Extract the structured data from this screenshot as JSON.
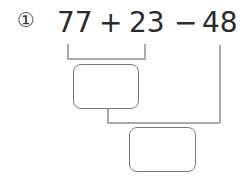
{
  "problem": {
    "number_label": "①",
    "terms": [
      "77",
      "23",
      "48"
    ],
    "operators": [
      "+",
      "−"
    ]
  },
  "answer_boxes": [
    {
      "value": ""
    },
    {
      "value": ""
    }
  ],
  "colors": {
    "text": "#2a2a2a",
    "connector": "#aaaaaa",
    "box_border": "#7a7a7a"
  }
}
